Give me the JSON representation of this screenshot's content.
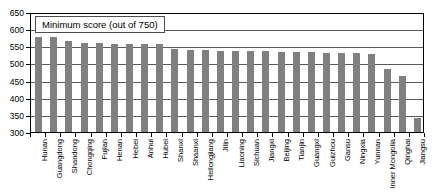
{
  "chart_data": {
    "type": "bar",
    "title": "Minimum score (out of 750)",
    "xlabel": "",
    "ylabel": "",
    "ylim": [
      300,
      650
    ],
    "yticks": [
      300,
      350,
      400,
      450,
      500,
      550,
      600,
      650
    ],
    "grid": true,
    "legend": "none",
    "bar_color": "#808080",
    "categories": [
      "Hunan",
      "Guangdong",
      "Shandong",
      "Chongqing",
      "Fujian",
      "Henan",
      "Hebei",
      "Anhui",
      "Hubei",
      "Shanxi",
      "Shaanxi",
      "Heilongjiang",
      "Jilin",
      "Liaoning",
      "Sichuan",
      "Jiangxi",
      "Beijing",
      "Tianjin",
      "Guangxi",
      "Guizhou",
      "Gansu",
      "Ningxia",
      "Yunnan",
      "Inner Mongolia",
      "Qinghai",
      "Jiangsu"
    ],
    "values": [
      580,
      579,
      568,
      563,
      562,
      561,
      561,
      561,
      560,
      545,
      543,
      542,
      540,
      540,
      539,
      538,
      537,
      536,
      535,
      534,
      533,
      532,
      531,
      487,
      467,
      345
    ]
  },
  "axis": {
    "y_unit": "score"
  }
}
